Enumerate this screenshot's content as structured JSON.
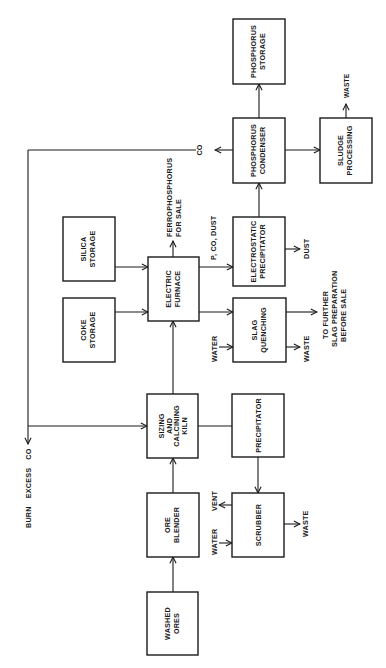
{
  "diagram": {
    "type": "process-flow",
    "orientation": "rotated-90-ccw",
    "nodes": {
      "phosphorus_storage": {
        "line1": "PHOSPHORUS",
        "line2": "STORAGE"
      },
      "phosphorus_condenser": {
        "line1": "PHOSPHORUS",
        "line2": "CONDENSER"
      },
      "sludge_processing": {
        "line1": "SLUDGE",
        "line2": "PROCESSING"
      },
      "silica_storage": {
        "line1": "SILICA",
        "line2": "STORAGE"
      },
      "coke_storage": {
        "line1": "COKE",
        "line2": "STORAGE"
      },
      "electric_furnace": {
        "line1": "ELECTRIC",
        "line2": "FURNACE"
      },
      "electrostatic_precipitator": {
        "line1": "ELECTROSTATIC",
        "line2": "PRECIPITATOR"
      },
      "slag_quenching": {
        "line1": "SLAG",
        "line2": "QUENCHING"
      },
      "kiln": {
        "line1": "SIZING",
        "line2": "AND",
        "line3": "CALCINING",
        "line4": "KILN"
      },
      "precipitator": {
        "line1": "PRECIPITATOR"
      },
      "ore_blender": {
        "line1": "ORE",
        "line2": "BLENDER"
      },
      "scrubber": {
        "line1": "SCRUBBER"
      },
      "washed_ores": {
        "line1": "WASHED",
        "line2": "ORES"
      }
    },
    "labels": {
      "co": "CO",
      "sludge_waste": "WASTE",
      "ferrophosphorus_line1": "FERROPHOSPHORUS",
      "ferrophosphorus_line2": "FOR SALE",
      "p_co_dust": "P, CO, DUST",
      "dust": "DUST",
      "slag_water": "WATER",
      "slag_waste": "WASTE",
      "further_line1": "TO FURTHER",
      "further_line2": "SLAG PREPARATION",
      "further_line3": "BEFORE SALE",
      "burn_excess_co": "BURN EXCESS CO",
      "scrubber_vent": "VENT",
      "scrubber_water": "WATER",
      "scrubber_waste": "WASTE"
    },
    "edges": [
      [
        "washed_ores",
        "ore_blender"
      ],
      [
        "ore_blender",
        "kiln"
      ],
      [
        "kiln",
        "electric_furnace"
      ],
      [
        "kiln",
        "precipitator"
      ],
      [
        "precipitator",
        "scrubber"
      ],
      [
        "silica_storage",
        "electric_furnace"
      ],
      [
        "coke_storage",
        "electric_furnace"
      ],
      [
        "electric_furnace",
        "electrostatic_precipitator"
      ],
      [
        "electric_furnace",
        "slag_quenching"
      ],
      [
        "electrostatic_precipitator",
        "phosphorus_condenser"
      ],
      [
        "phosphorus_condenser",
        "phosphorus_storage"
      ],
      [
        "phosphorus_condenser",
        "sludge_processing"
      ],
      [
        "phosphorus_condenser",
        "kiln"
      ]
    ]
  }
}
